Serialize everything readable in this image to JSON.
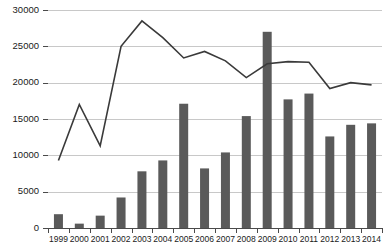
{
  "chart_data": {
    "type": "bar",
    "title": "",
    "subtitle": "",
    "xlabel": "",
    "ylabel": "",
    "categories": [
      "1999",
      "2000",
      "2001",
      "2002",
      "2003",
      "2004",
      "2005",
      "2006",
      "2007",
      "2008",
      "2009",
      "2010",
      "2011",
      "2012",
      "2013",
      "2014"
    ],
    "series": [
      {
        "name": "bars",
        "type": "bar",
        "values": [
          1900,
          600,
          1700,
          4200,
          7800,
          9300,
          17100,
          8200,
          10400,
          15400,
          27000,
          17700,
          18500,
          12600,
          14200,
          14400
        ]
      },
      {
        "name": "line",
        "type": "line",
        "values": [
          9300,
          17000,
          11300,
          25000,
          28500,
          26200,
          23400,
          24300,
          23000,
          20700,
          22600,
          22900,
          22800,
          19200,
          20000,
          19700
        ]
      }
    ],
    "ylim": [
      0,
      30000
    ],
    "yticks": [
      0,
      5000,
      10000,
      15000,
      20000,
      25000,
      30000
    ],
    "ytick_labels": [
      "0",
      "5000",
      "10000",
      "15000",
      "20000",
      "25000",
      "30000"
    ],
    "xtick_labels": [
      "1999",
      "2000",
      "2001",
      "2002",
      "2003",
      "2004",
      "2005",
      "2006",
      "2007",
      "2008",
      "2009",
      "2010",
      "2011",
      "2012",
      "2013",
      "2014"
    ],
    "grid": true,
    "grid_axis": "y",
    "legend": false,
    "legend_position": "none",
    "colors": {
      "bar": "#5a5a5a",
      "line": "#3a3a3a",
      "grid": "#c8c8c8",
      "axis": "#4a4a4a",
      "text": "#1a1a1a",
      "background": "#ffffff"
    }
  }
}
